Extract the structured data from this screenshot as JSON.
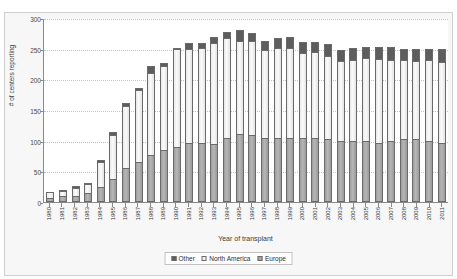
{
  "chart_data": {
    "type": "bar",
    "stacked": true,
    "title": "",
    "xlabel": "Year of transplant",
    "ylabel": "# of centers reporting",
    "ylim": [
      0,
      300
    ],
    "yticks": [
      0,
      50,
      100,
      150,
      200,
      250,
      300
    ],
    "grid": true,
    "legend_position": "bottom",
    "categories": [
      "1980",
      "1981",
      "1982",
      "1983",
      "1984",
      "1985",
      "1986",
      "1987",
      "1988",
      "1989",
      "1990",
      "1991",
      "1992",
      "1993",
      "1994",
      "1995",
      "1996",
      "1997",
      "1998",
      "1999",
      "2000",
      "2001",
      "2002",
      "2003",
      "2004",
      "2005",
      "2006",
      "2007",
      "2008",
      "2009",
      "2010",
      "2011"
    ],
    "series": [
      {
        "name": "Europe",
        "color": "#a9a9a9",
        "values": [
          7,
          9,
          10,
          15,
          24,
          38,
          56,
          65,
          77,
          85,
          89,
          96,
          96,
          95,
          105,
          111,
          110,
          104,
          104,
          105,
          105,
          105,
          103,
          99,
          99,
          99,
          97,
          99,
          102,
          102,
          100,
          96
        ]
      },
      {
        "name": "North America",
        "color": "#f2f2f2",
        "values": [
          10,
          9,
          13,
          14,
          42,
          72,
          100,
          118,
          134,
          136,
          160,
          154,
          155,
          165,
          163,
          152,
          152,
          144,
          147,
          146,
          138,
          139,
          135,
          131,
          132,
          135,
          136,
          132,
          130,
          128,
          131,
          132
        ]
      },
      {
        "name": "Other",
        "color": "#5d5d5d",
        "values": [
          0,
          2,
          3,
          2,
          2,
          4,
          5,
          3,
          10,
          6,
          2,
          10,
          9,
          9,
          10,
          18,
          13,
          15,
          16,
          18,
          18,
          17,
          19,
          18,
          20,
          18,
          19,
          22,
          18,
          19,
          19,
          21
        ]
      }
    ],
    "totals": [
      17,
      20,
      26,
      31,
      68,
      114,
      161,
      186,
      221,
      227,
      251,
      260,
      260,
      269,
      278,
      281,
      275,
      263,
      267,
      269,
      261,
      261,
      257,
      248,
      251,
      252,
      252,
      253,
      250,
      249,
      250,
      249
    ]
  },
  "legend": {
    "items": [
      {
        "label": "Other",
        "swatch": "#5d5d5d"
      },
      {
        "label": "North America",
        "swatch": "#f2f2f2"
      },
      {
        "label": "Europe",
        "swatch": "#a9a9a9"
      }
    ]
  }
}
